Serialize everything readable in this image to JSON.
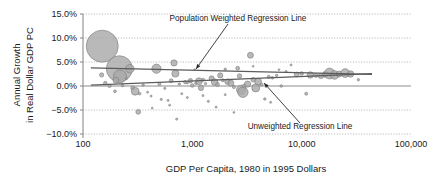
{
  "chart_data": {
    "type": "scatter",
    "title": "",
    "xlabel": "GDP Per Capita, 1980 in 1995 Dollars",
    "ylabel_line1": "Annual Growth",
    "ylabel_line2": "in Real Dollar GDP PC",
    "xscale": "log",
    "xlim": [
      100,
      100000
    ],
    "ylim": [
      -0.1,
      0.15
    ],
    "grid": true,
    "legend": "none",
    "xticks": [
      100,
      1000,
      10000,
      100000
    ],
    "xtick_labels": [
      "100",
      "1,000",
      "10,000",
      "100,000"
    ],
    "yticks": [
      0.15,
      0.1,
      0.05,
      0.0,
      -0.05,
      -0.1
    ],
    "ytick_labels": [
      "15.0%",
      "10.0%",
      "5.0%",
      "0.0%",
      "-5.0%",
      "-10.0%"
    ],
    "marker_size_encodes": "population",
    "annotations": [
      {
        "id": "population-weighted-regression-line",
        "text": "Population Weighted Regression Line",
        "text_x": 255,
        "text_y": 1000,
        "leader_from": [
          680,
          1020
        ],
        "leader_to": [
          760,
          330
        ]
      },
      {
        "id": "unweighted-regression-line",
        "text": "Unweighted Regression Line",
        "text_x": 3000,
        "text_y": -790,
        "leader_from": [
          4200,
          -740
        ],
        "leader_to": [
          5400,
          200
        ]
      }
    ],
    "series": [
      {
        "name": "Population Weighted Regression Line",
        "type": "line",
        "x": [
          118,
          44000
        ],
        "y": [
          0.038,
          0.024
        ]
      },
      {
        "name": "Unweighted Regression Line",
        "type": "line",
        "x": [
          118,
          44000
        ],
        "y": [
          0.002,
          0.026
        ]
      },
      {
        "name": "Countries",
        "type": "bubble",
        "note": "x = GDP per capita 1980 (1995 USD), y = annual growth in real dollar GDP per capita, r = relative population",
        "points": [
          {
            "x": 150,
            "y": 0.083,
            "r": 16.0
          },
          {
            "x": 215,
            "y": 0.036,
            "r": 13.0
          },
          {
            "x": 218,
            "y": 0.02,
            "r": 6.5
          },
          {
            "x": 200,
            "y": 0.012,
            "r": 3.0
          },
          {
            "x": 148,
            "y": 0.023,
            "r": 2.1
          },
          {
            "x": 160,
            "y": 0.006,
            "r": 1.8
          },
          {
            "x": 175,
            "y": 0.0,
            "r": 1.6
          },
          {
            "x": 196,
            "y": -0.011,
            "r": 1.4
          },
          {
            "x": 230,
            "y": 0.001,
            "r": 1.3
          },
          {
            "x": 250,
            "y": 0.016,
            "r": 1.2
          },
          {
            "x": 268,
            "y": 0.036,
            "r": 4.3
          },
          {
            "x": 285,
            "y": -0.004,
            "r": 2.0
          },
          {
            "x": 300,
            "y": -0.011,
            "r": 3.9
          },
          {
            "x": 320,
            "y": -0.054,
            "r": 2.4
          },
          {
            "x": 330,
            "y": -0.016,
            "r": 1.3
          },
          {
            "x": 355,
            "y": 0.002,
            "r": 1.2
          },
          {
            "x": 390,
            "y": -0.013,
            "r": 1.0
          },
          {
            "x": 420,
            "y": -0.021,
            "r": 1.0
          },
          {
            "x": 470,
            "y": 0.036,
            "r": 4.6
          },
          {
            "x": 500,
            "y": 0.004,
            "r": 1.5
          },
          {
            "x": 520,
            "y": -0.028,
            "r": 1.1
          },
          {
            "x": 560,
            "y": -0.005,
            "r": 1.1
          },
          {
            "x": 600,
            "y": -0.03,
            "r": 1.0
          },
          {
            "x": 640,
            "y": 0.011,
            "r": 1.9
          },
          {
            "x": 680,
            "y": 0.048,
            "r": 3.1
          },
          {
            "x": 700,
            "y": 0.026,
            "r": 3.6
          },
          {
            "x": 720,
            "y": -0.069,
            "r": 1.1
          },
          {
            "x": 760,
            "y": 0.004,
            "r": 1.2
          },
          {
            "x": 800,
            "y": -0.016,
            "r": 1.0
          },
          {
            "x": 860,
            "y": 0.008,
            "r": 1.6
          },
          {
            "x": 900,
            "y": 0.007,
            "r": 1.3
          },
          {
            "x": 960,
            "y": 0.011,
            "r": 2.2
          },
          {
            "x": 1000,
            "y": 0.001,
            "r": 1.8
          },
          {
            "x": 1080,
            "y": 0.006,
            "r": 1.4
          },
          {
            "x": 1150,
            "y": 0.01,
            "r": 3.4
          },
          {
            "x": 1200,
            "y": -0.004,
            "r": 2.6
          },
          {
            "x": 1260,
            "y": 0.013,
            "r": 1.4
          },
          {
            "x": 1320,
            "y": 0.005,
            "r": 1.2
          },
          {
            "x": 1400,
            "y": -0.032,
            "r": 1.1
          },
          {
            "x": 1500,
            "y": 0.016,
            "r": 2.5
          },
          {
            "x": 1600,
            "y": 0.008,
            "r": 3.3
          },
          {
            "x": 1700,
            "y": 0.003,
            "r": 1.9
          },
          {
            "x": 1800,
            "y": 0.022,
            "r": 2.6
          },
          {
            "x": 1900,
            "y": 0.012,
            "r": 1.5
          },
          {
            "x": 2000,
            "y": 0.035,
            "r": 1.2
          },
          {
            "x": 2100,
            "y": 0.009,
            "r": 2.8
          },
          {
            "x": 2250,
            "y": 0.006,
            "r": 3.0
          },
          {
            "x": 2400,
            "y": -0.002,
            "r": 1.6
          },
          {
            "x": 2600,
            "y": 0.037,
            "r": 1.9
          },
          {
            "x": 2700,
            "y": 0.021,
            "r": 2.2
          },
          {
            "x": 2800,
            "y": -0.008,
            "r": 4.7
          },
          {
            "x": 2900,
            "y": -0.013,
            "r": 5.2
          },
          {
            "x": 3000,
            "y": 0.0,
            "r": 2.0
          },
          {
            "x": 3200,
            "y": 0.004,
            "r": 3.1
          },
          {
            "x": 3400,
            "y": 0.064,
            "r": 3.0
          },
          {
            "x": 3600,
            "y": 0.013,
            "r": 2.3
          },
          {
            "x": 3800,
            "y": -0.004,
            "r": 4.0
          },
          {
            "x": 4000,
            "y": 0.009,
            "r": 3.4
          },
          {
            "x": 4300,
            "y": 0.003,
            "r": 1.4
          },
          {
            "x": 4600,
            "y": -0.027,
            "r": 1.2
          },
          {
            "x": 5000,
            "y": 0.019,
            "r": 1.6
          },
          {
            "x": 5400,
            "y": 0.017,
            "r": 1.3
          },
          {
            "x": 5900,
            "y": 0.022,
            "r": 1.2
          },
          {
            "x": 6500,
            "y": 0.0,
            "r": 1.3
          },
          {
            "x": 7200,
            "y": 0.03,
            "r": 1.1
          },
          {
            "x": 8000,
            "y": 0.044,
            "r": 1.0
          },
          {
            "x": 9000,
            "y": 0.024,
            "r": 2.4
          },
          {
            "x": 10000,
            "y": 0.026,
            "r": 1.8
          },
          {
            "x": 11000,
            "y": -0.016,
            "r": 1.5
          },
          {
            "x": 12000,
            "y": 0.023,
            "r": 3.2
          },
          {
            "x": 13500,
            "y": 0.022,
            "r": 2.0
          },
          {
            "x": 15000,
            "y": 0.021,
            "r": 2.6
          },
          {
            "x": 16500,
            "y": 0.024,
            "r": 3.0
          },
          {
            "x": 18000,
            "y": 0.026,
            "r": 5.4
          },
          {
            "x": 20000,
            "y": 0.023,
            "r": 4.3
          },
          {
            "x": 22000,
            "y": 0.025,
            "r": 3.0
          },
          {
            "x": 25000,
            "y": 0.027,
            "r": 4.4
          },
          {
            "x": 28000,
            "y": 0.025,
            "r": 3.2
          },
          {
            "x": 33000,
            "y": 0.013,
            "r": 1.2
          },
          {
            "x": 2000,
            "y": -0.018,
            "r": 1.0
          },
          {
            "x": 1250,
            "y": -0.02,
            "r": 1.0
          },
          {
            "x": 900,
            "y": -0.024,
            "r": 1.0
          },
          {
            "x": 620,
            "y": -0.04,
            "r": 1.0
          },
          {
            "x": 1650,
            "y": -0.044,
            "r": 1.0
          },
          {
            "x": 2400,
            "y": -0.055,
            "r": 0.9
          },
          {
            "x": 5200,
            "y": -0.034,
            "r": 1.0
          },
          {
            "x": 430,
            "y": -0.046,
            "r": 0.9
          },
          {
            "x": 3600,
            "y": 0.041,
            "r": 0.9
          },
          {
            "x": 1050,
            "y": 0.034,
            "r": 0.9
          },
          {
            "x": 6200,
            "y": 0.034,
            "r": 0.9
          }
        ]
      }
    ]
  }
}
